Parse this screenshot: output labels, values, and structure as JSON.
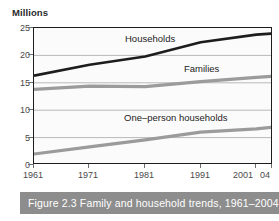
{
  "figure": {
    "caption": "Figure 2.3 Family and household trends, 1961–2004",
    "yaxis_title": "Millions"
  },
  "chart_data": {
    "type": "line",
    "title": "Figure 2.3 Family and household trends, 1961–2004",
    "xlabel": "",
    "ylabel": "Millions",
    "ylim": [
      0,
      25
    ],
    "yticks": [
      0,
      5,
      10,
      15,
      20,
      25
    ],
    "ytick_labels": [
      "0",
      "5",
      "10",
      "15",
      "20",
      "25"
    ],
    "xlim": [
      1961,
      2004
    ],
    "xticks": [
      1961,
      1971,
      1981,
      1991,
      2001,
      2004
    ],
    "xtick_labels": [
      "1961",
      "1971",
      "1981",
      "1991",
      "2001",
      "04"
    ],
    "grid": "horizontal",
    "legend": "inline-labels",
    "x": [
      1961,
      1971,
      1981,
      1991,
      2001,
      2004
    ],
    "series": [
      {
        "name": "Households",
        "color": "#1d1d1d",
        "values": [
          16.3,
          18.3,
          19.8,
          22.4,
          23.8,
          24.0
        ]
      },
      {
        "name": "Families",
        "color": "#9b9b9b",
        "values": [
          13.8,
          14.4,
          14.3,
          15.2,
          16.0,
          16.2
        ]
      },
      {
        "name": "One–person households",
        "color": "#9b9b9b",
        "values": [
          2.0,
          3.3,
          4.6,
          6.0,
          6.6,
          6.9
        ]
      }
    ],
    "annotations": [
      {
        "text": "Households",
        "x": 1978,
        "y": 23.2
      },
      {
        "text": "Families",
        "x": 1996,
        "y": 17.6
      },
      {
        "text": "One–person households",
        "x": 1981,
        "y": 9.4
      }
    ]
  }
}
